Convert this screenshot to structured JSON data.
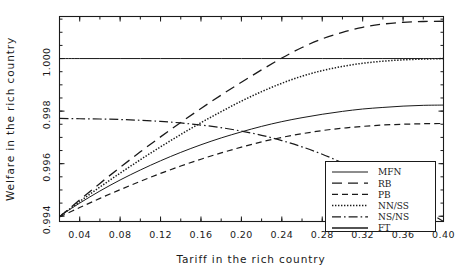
{
  "chart_data": {
    "type": "line",
    "title": "",
    "xlabel": "Tariff in the rich country",
    "ylabel": "Welfare in the rich country",
    "xlim": [
      0.02,
      0.4
    ],
    "ylim": [
      0.9938,
      1.0016
    ],
    "grid": false,
    "legend_position": "bottom-right",
    "xticks": [
      0.04,
      0.08,
      0.12,
      0.16,
      0.2,
      0.24,
      0.28,
      0.32,
      0.36,
      0.4
    ],
    "xtick_labels": [
      "0.04",
      "0.08",
      "0.12",
      "0.16",
      "0.20",
      "0.24",
      "0.28",
      "0.32",
      "0.36",
      "0.40"
    ],
    "yticks": [
      0.994,
      0.996,
      0.998,
      1.0
    ],
    "ytick_labels": [
      "0.994",
      "0.996",
      "0.998",
      "1.000"
    ],
    "x": [
      0.02,
      0.04,
      0.06,
      0.08,
      0.1,
      0.12,
      0.14,
      0.16,
      0.18,
      0.2,
      0.22,
      0.24,
      0.26,
      0.28,
      0.3,
      0.32,
      0.34,
      0.36,
      0.38,
      0.4
    ],
    "series": [
      {
        "name": "MFN",
        "dash": "solid",
        "values": [
          0.994,
          0.9945,
          0.99496,
          0.99538,
          0.99576,
          0.99611,
          0.99643,
          0.99672,
          0.99698,
          0.99721,
          0.99742,
          0.9976,
          0.99775,
          0.99788,
          0.99799,
          0.99808,
          0.99814,
          0.99819,
          0.99822,
          0.99823
        ]
      },
      {
        "name": "RB",
        "dash": "long-dash",
        "values": [
          0.99398,
          0.99462,
          0.99525,
          0.99586,
          0.99645,
          0.99702,
          0.99757,
          0.9981,
          0.99861,
          0.9991,
          0.99957,
          1.00002,
          1.00042,
          1.00075,
          1.001,
          1.00119,
          1.00131,
          1.00138,
          1.00141,
          1.00142
        ]
      },
      {
        "name": "PB",
        "dash": "short-dash",
        "values": [
          0.99397,
          0.99433,
          0.99468,
          0.99501,
          0.99533,
          0.99563,
          0.99591,
          0.99617,
          0.99641,
          0.99663,
          0.99683,
          0.997,
          0.99714,
          0.99726,
          0.99735,
          0.99742,
          0.99747,
          0.9975,
          0.99752,
          0.99753
        ]
      },
      {
        "name": "NN/SS",
        "dash": "dotted",
        "values": [
          0.99399,
          0.99456,
          0.99511,
          0.99564,
          0.99615,
          0.99664,
          0.99711,
          0.99756,
          0.99798,
          0.99838,
          0.99874,
          0.99906,
          0.99933,
          0.99954,
          0.9997,
          0.99982,
          0.9999,
          0.99995,
          0.99998,
          1.0
        ]
      },
      {
        "name": "NS/NS",
        "dash": "dash-dot",
        "values": [
          0.99772,
          0.99771,
          0.9977,
          0.99768,
          0.99765,
          0.99761,
          0.99755,
          0.99747,
          0.99737,
          0.99724,
          0.99708,
          0.99688,
          0.99664,
          0.99636,
          0.99603,
          0.99566,
          0.99524,
          0.99478,
          0.99428,
          0.99374
        ]
      },
      {
        "name": "FT",
        "dash": "solid",
        "values": [
          1.0,
          1.0,
          1.0,
          1.0,
          1.0,
          1.0,
          1.0,
          1.0,
          1.0,
          1.0,
          1.0,
          1.0,
          1.0,
          1.0,
          1.0,
          1.0,
          1.0,
          1.0,
          1.0,
          1.0
        ]
      }
    ],
    "legend_entries": [
      "MFN",
      "RB",
      "PB",
      "NN/SS",
      "NS/NS",
      "FT"
    ],
    "colors": {
      "line": "#1a1a1a",
      "background": "#ffffff"
    }
  }
}
